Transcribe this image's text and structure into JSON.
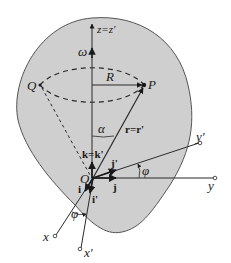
{
  "diagram": {
    "type": "rotating reference frame geometry",
    "colors": {
      "region_fill": "#cfcfcf",
      "region_stroke": "#555555",
      "line": "#2a2a2a",
      "background": "#ffffff"
    },
    "labels": {
      "z_axis": "z=z'",
      "omega": "ω",
      "Q": "Q",
      "R": "R",
      "P": "P",
      "alpha": "α",
      "r_vec": "r=r'",
      "k_vec": "k=k'",
      "y_prime": "y'",
      "phi_upper": "φ",
      "i_prime_upper": "j'",
      "j_upper": "j",
      "y": "y",
      "origin": "O",
      "i_vec": "i",
      "i_prime": "i'",
      "phi_lower": "φ",
      "x": "x",
      "x_prime": "x'"
    }
  }
}
